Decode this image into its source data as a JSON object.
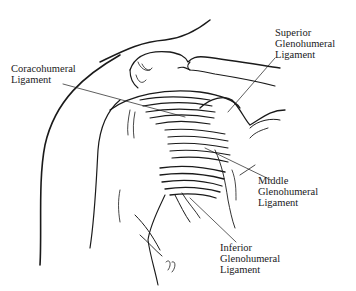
{
  "figure": {
    "labels": [
      {
        "id": "superior",
        "lines": [
          "Superior",
          "Glenohumeral",
          "Ligament"
        ]
      },
      {
        "id": "coracohumeral",
        "lines": [
          "Coracohumeral",
          "Ligament"
        ]
      },
      {
        "id": "middle",
        "lines": [
          "Middle",
          "Glenohumeral",
          "Ligament"
        ]
      },
      {
        "id": "inferior",
        "lines": [
          "Inferior",
          "Glenohumeral",
          "Ligament"
        ]
      }
    ],
    "colors": {
      "ink": "#1a1a1a",
      "background": "#ffffff"
    }
  }
}
